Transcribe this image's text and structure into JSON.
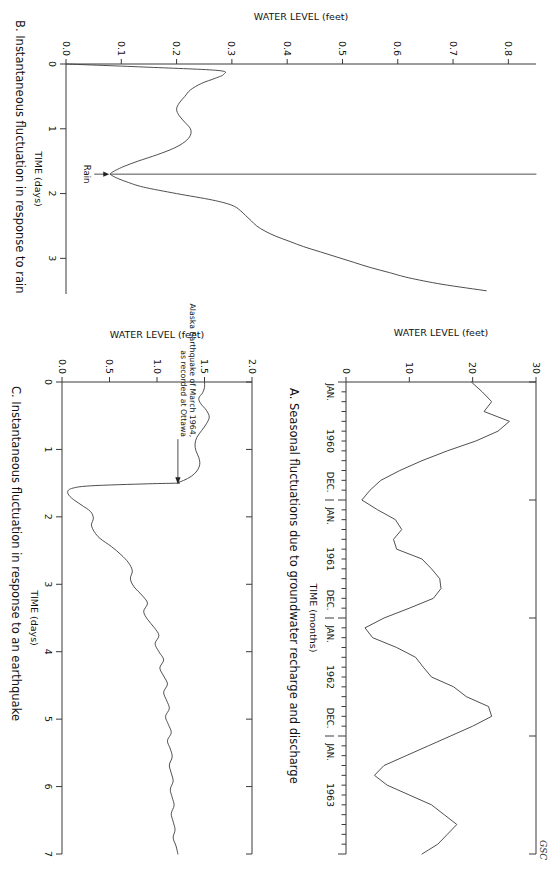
{
  "figure": {
    "credit": "GSC"
  },
  "chart_data": [
    {
      "id": "A",
      "type": "line",
      "title": "A. Seasonal fluctuations due to groundwater recharge and discharge",
      "xlabel": "TIME (months)",
      "ylabel": "WATER LEVEL (feet)",
      "ylim": [
        0,
        30
      ],
      "ytick_labels": [
        "0",
        "10",
        "20",
        "30"
      ],
      "ytick_values": [
        0,
        10,
        20,
        30
      ],
      "xlim": [
        0,
        48
      ],
      "xtick_group_labels": [
        "JAN.",
        "1960",
        "DEC.",
        "JAN.",
        "1961",
        "DEC.",
        "JAN.",
        "1962",
        "DEC.",
        "JAN.",
        "1963"
      ],
      "x_year_labels": [
        "1960",
        "1961",
        "1962",
        "1963"
      ],
      "x_boundary_labels": [
        "JAN.",
        "DEC.",
        "JAN.",
        "DEC.",
        "JAN.",
        "DEC.",
        "JAN."
      ],
      "minor_tick_interval_months": 1,
      "grid": false,
      "x": [
        0,
        1,
        2,
        3,
        4,
        5,
        6,
        7,
        8,
        9,
        10,
        11,
        12,
        13,
        14,
        15,
        16,
        17,
        18,
        19,
        20,
        21,
        22,
        23,
        24,
        25,
        26,
        27,
        28,
        29,
        30,
        31,
        32,
        33,
        34,
        35,
        36,
        37,
        38,
        39,
        40,
        41,
        42,
        43,
        44,
        45,
        46,
        47,
        48
      ],
      "values": [
        19.8,
        21.5,
        23.0,
        21.8,
        25.8,
        24.0,
        20.5,
        16.0,
        12.0,
        8.5,
        5.5,
        3.8,
        2.5,
        5.0,
        7.8,
        8.8,
        7.5,
        8.0,
        12.0,
        13.5,
        14.8,
        15.0,
        13.8,
        10.0,
        6.0,
        3.0,
        4.2,
        8.0,
        11.0,
        12.2,
        13.5,
        17.0,
        19.0,
        22.5,
        23.0,
        20.0,
        16.5,
        13.0,
        9.5,
        6.0,
        4.5,
        6.5,
        10.0,
        13.5,
        15.5,
        17.5,
        16.0,
        14.5,
        12.0
      ]
    },
    {
      "id": "B",
      "type": "line",
      "title": "B. Instantaneous fluctuation in response to rain",
      "xlabel": "TIME (days)",
      "ylabel": "WATER LEVEL (feet)",
      "ylim": [
        0.0,
        0.85
      ],
      "ytick_labels": [
        "0.0",
        "0.1",
        "0.2",
        "0.3",
        "0.4",
        "0.5",
        "0.6",
        "0.7",
        "0.8"
      ],
      "ytick_values": [
        0.0,
        0.1,
        0.2,
        0.3,
        0.4,
        0.5,
        0.6,
        0.7,
        0.8
      ],
      "xlim": [
        0,
        3.55
      ],
      "xtick_labels": [
        "0",
        "1",
        "2",
        "3"
      ],
      "xtick_values": [
        0,
        1,
        2,
        3
      ],
      "grid": false,
      "annotation": {
        "label": "Rain",
        "x": 1.7,
        "y": 0.08
      },
      "x": [
        0.0,
        0.05,
        0.1,
        0.16,
        0.22,
        0.3,
        0.4,
        0.5,
        0.6,
        0.7,
        0.8,
        0.9,
        1.0,
        1.1,
        1.2,
        1.3,
        1.4,
        1.5,
        1.58,
        1.64,
        1.68,
        1.7,
        1.72,
        1.76,
        1.82,
        1.9,
        2.0,
        2.1,
        2.18,
        2.26,
        2.34,
        2.42,
        2.5,
        2.58,
        2.66,
        2.74,
        2.82,
        2.9,
        2.98,
        3.06,
        3.14,
        3.22,
        3.3,
        3.4,
        3.5
      ],
      "values": [
        0.0,
        0.15,
        0.275,
        0.285,
        0.27,
        0.245,
        0.225,
        0.215,
        0.205,
        0.2,
        0.205,
        0.215,
        0.225,
        0.225,
        0.215,
        0.195,
        0.165,
        0.13,
        0.105,
        0.09,
        0.082,
        0.08,
        0.083,
        0.092,
        0.11,
        0.14,
        0.2,
        0.265,
        0.3,
        0.315,
        0.325,
        0.335,
        0.345,
        0.36,
        0.38,
        0.405,
        0.43,
        0.46,
        0.49,
        0.52,
        0.55,
        0.585,
        0.62,
        0.68,
        0.76
      ]
    },
    {
      "id": "C",
      "type": "line",
      "title": "C. Instantaneous fluctuation in response to an earthquake",
      "xlabel": "TIME (days)",
      "ylabel": "WATER LEVEL (feet)",
      "ylim": [
        0.0,
        2.0
      ],
      "ytick_labels": [
        "0.0",
        "0.5",
        "1.0",
        "1.5",
        "2.0"
      ],
      "ytick_values": [
        0.0,
        0.5,
        1.0,
        1.5,
        2.0
      ],
      "xlim": [
        0,
        7
      ],
      "xtick_labels": [
        "0",
        "1",
        "2",
        "3",
        "4",
        "5",
        "6",
        "7"
      ],
      "xtick_values": [
        0,
        1,
        2,
        3,
        4,
        5,
        6,
        7
      ],
      "grid": false,
      "annotation": {
        "label_line1": "Alaska Earthquake of March 1964,",
        "label_line2": "as recorded at Ottawa",
        "x": 1.5,
        "y": 1.22
      },
      "x": [
        0.0,
        0.08,
        0.16,
        0.24,
        0.32,
        0.42,
        0.52,
        0.62,
        0.72,
        0.82,
        0.92,
        1.02,
        1.12,
        1.22,
        1.32,
        1.4,
        1.46,
        1.49,
        1.5,
        1.51,
        1.54,
        1.58,
        1.64,
        1.72,
        1.82,
        1.92,
        2.02,
        2.12,
        2.22,
        2.32,
        2.44,
        2.56,
        2.68,
        2.8,
        2.92,
        3.04,
        3.16,
        3.28,
        3.4,
        3.52,
        3.64,
        3.76,
        3.88,
        4.0,
        4.12,
        4.24,
        4.36,
        4.48,
        4.6,
        4.72,
        4.84,
        4.96,
        5.08,
        5.2,
        5.32,
        5.44,
        5.56,
        5.68,
        5.8,
        5.92,
        6.04,
        6.16,
        6.28,
        6.4,
        6.52,
        6.64,
        6.76,
        6.88,
        7.0
      ],
      "values": [
        1.5,
        1.5,
        1.48,
        1.44,
        1.46,
        1.52,
        1.55,
        1.52,
        1.47,
        1.42,
        1.4,
        1.41,
        1.44,
        1.45,
        1.42,
        1.36,
        1.28,
        1.22,
        1.22,
        0.9,
        0.3,
        0.1,
        0.06,
        0.1,
        0.2,
        0.3,
        0.33,
        0.31,
        0.34,
        0.4,
        0.52,
        0.62,
        0.7,
        0.74,
        0.72,
        0.76,
        0.84,
        0.9,
        0.86,
        0.9,
        0.97,
        1.02,
        0.98,
        1.02,
        1.07,
        1.03,
        1.07,
        1.11,
        1.07,
        1.1,
        1.13,
        1.09,
        1.12,
        1.15,
        1.11,
        1.14,
        1.16,
        1.13,
        1.15,
        1.17,
        1.14,
        1.16,
        1.18,
        1.15,
        1.17,
        1.19,
        1.17,
        1.2,
        1.22
      ]
    }
  ]
}
